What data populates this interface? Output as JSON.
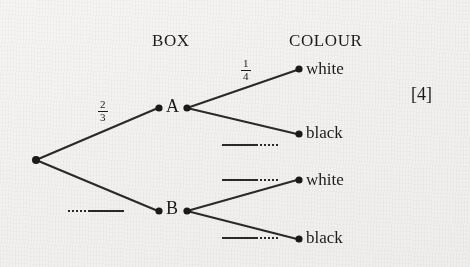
{
  "diagram": {
    "type": "probability-tree-diagram",
    "headers": {
      "stage1": "BOX",
      "stage2": "COLOUR"
    },
    "nodes": {
      "root": "",
      "box_a": "A",
      "box_b": "B"
    },
    "leaves": [
      {
        "id": "a-white",
        "label": "white"
      },
      {
        "id": "a-black",
        "label": "black"
      },
      {
        "id": "b-white",
        "label": "white"
      },
      {
        "id": "b-black",
        "label": "black"
      }
    ],
    "branch_labels": [
      {
        "id": "root-a",
        "value": "2/3",
        "numerator": "2",
        "denominator": "3",
        "filled": true
      },
      {
        "id": "root-b",
        "value": "",
        "numerator": "",
        "denominator": "",
        "filled": false
      },
      {
        "id": "a-white",
        "value": "1/4",
        "numerator": "1",
        "denominator": "4",
        "filled": true
      },
      {
        "id": "a-black",
        "value": "",
        "numerator": "",
        "denominator": "",
        "filled": false
      },
      {
        "id": "b-white",
        "value": "",
        "numerator": "",
        "denominator": "",
        "filled": false
      },
      {
        "id": "b-black",
        "value": "",
        "numerator": "",
        "denominator": "",
        "filled": false
      }
    ],
    "marks": "[4]",
    "colors": {
      "ink": "#1b1a19",
      "line": "#2a2927",
      "paper": "#f2f1ef"
    }
  }
}
